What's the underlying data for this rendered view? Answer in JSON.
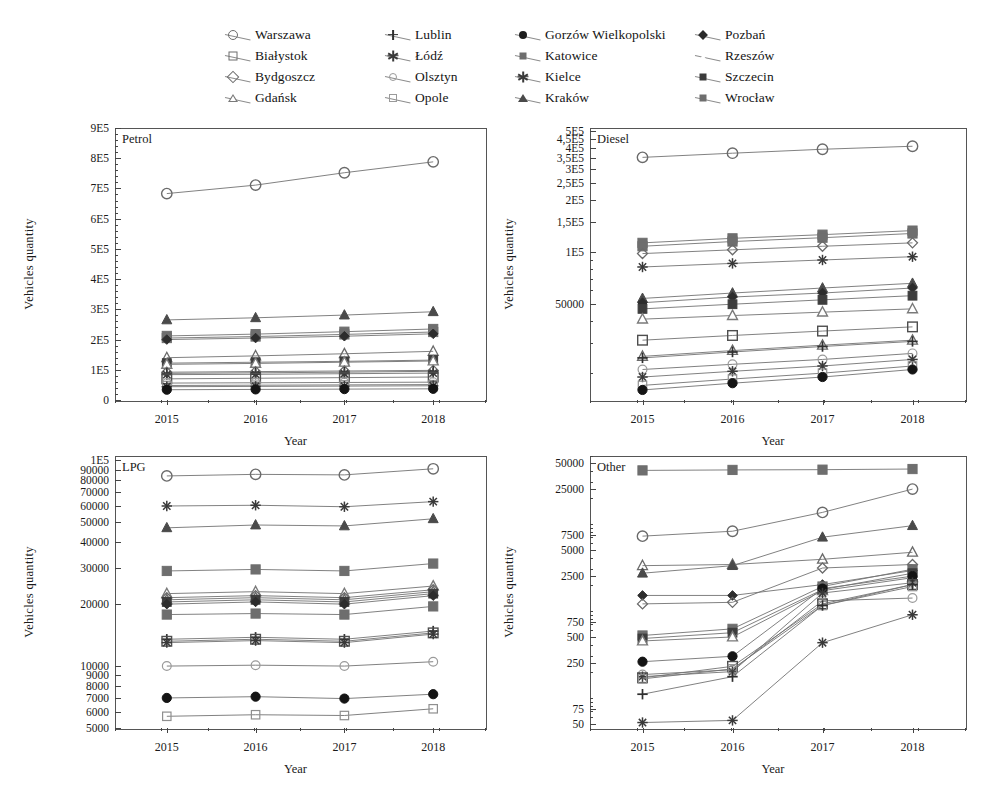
{
  "figure": {
    "axis_y_label": "Vehicles quantity",
    "axis_x_label": "Year",
    "years": [
      "2015",
      "2016",
      "2017",
      "2018"
    ]
  },
  "legend": {
    "columns": [
      {
        "items": [
          {
            "label": "Warszawa",
            "marker": "circle-o"
          },
          {
            "label": "Białystok",
            "marker": "square-o"
          },
          {
            "label": "Bydgoszcz",
            "marker": "diamond-o"
          },
          {
            "label": "Gdańsk",
            "marker": "tri-ow"
          }
        ]
      },
      {
        "items": [
          {
            "label": "Lublin",
            "marker": "plus"
          },
          {
            "label": "Łódź",
            "marker": "star"
          },
          {
            "label": "Olsztyn",
            "marker": "circle-sm"
          },
          {
            "label": "Opole",
            "marker": "square-sm"
          }
        ]
      },
      {
        "items": [
          {
            "label": "Gorzów Wielkopolski",
            "marker": "circle-f"
          },
          {
            "label": "Katowice",
            "marker": "square-f"
          },
          {
            "label": "Kielce",
            "marker": "star"
          },
          {
            "label": "Kraków",
            "marker": "tri-f"
          }
        ]
      },
      {
        "items": [
          {
            "label": "Pozbań",
            "marker": "diamond-f"
          },
          {
            "label": "Rzeszów",
            "marker": "tri-o"
          },
          {
            "label": "Szczecin",
            "marker": "square-dk"
          },
          {
            "label": "Wrocław",
            "marker": "square-f"
          }
        ]
      }
    ]
  },
  "chart_data": [
    {
      "type": "line",
      "title": "Petrol",
      "xlabel": "Year",
      "ylabel": "Vehicles quantity",
      "x": [
        "2015",
        "2016",
        "2017",
        "2018"
      ],
      "yscale": "linear",
      "ylim": [
        0,
        900000
      ],
      "ytick_labels": [
        "0",
        "1E5",
        "2E5",
        "3E5",
        "4E5",
        "5E5",
        "6E5",
        "7E5",
        "8E5",
        "9E5"
      ],
      "ytick_values": [
        0,
        100000,
        200000,
        300000,
        400000,
        500000,
        600000,
        700000,
        800000,
        900000
      ],
      "grid": false,
      "legend_position": "top-external",
      "series": [
        {
          "name": "Warszawa",
          "marker": "circle-o",
          "values": [
            683000,
            711000,
            752000,
            788000
          ]
        },
        {
          "name": "Kraków",
          "marker": "tri-f",
          "values": [
            265000,
            272000,
            281000,
            292000
          ]
        },
        {
          "name": "Wrocław",
          "marker": "square-f",
          "values": [
            212000,
            218000,
            226000,
            235000
          ]
        },
        {
          "name": "Katowice",
          "marker": "square-f",
          "values": [
            205000,
            210000,
            217000,
            225000
          ]
        },
        {
          "name": "Pozbań",
          "marker": "diamond-f",
          "values": [
            200000,
            205000,
            211000,
            219000
          ]
        },
        {
          "name": "Rzeszów",
          "marker": "tri-o",
          "values": [
            140000,
            146000,
            153000,
            161000
          ]
        },
        {
          "name": "Szczecin",
          "marker": "square-dk",
          "values": [
            122000,
            125000,
            128000,
            132000
          ]
        },
        {
          "name": "Gdańsk",
          "marker": "tri-ow",
          "values": [
            118000,
            121000,
            125000,
            129000
          ]
        },
        {
          "name": "Bydgoszcz",
          "marker": "diamond-o",
          "values": [
            92000,
            94000,
            96000,
            98000
          ]
        },
        {
          "name": "Lublin",
          "marker": "plus",
          "values": [
            88000,
            90000,
            92000,
            95000
          ]
        },
        {
          "name": "Łódź",
          "marker": "star",
          "values": [
            84000,
            85000,
            87000,
            89000
          ]
        },
        {
          "name": "Białystok",
          "marker": "square-o",
          "values": [
            70000,
            72000,
            74000,
            76000
          ]
        },
        {
          "name": "Olsztyn",
          "marker": "circle-sm",
          "values": [
            56000,
            57000,
            58000,
            59000
          ]
        },
        {
          "name": "Opole",
          "marker": "square-sm",
          "values": [
            48000,
            49000,
            50000,
            51000
          ]
        },
        {
          "name": "Kielce",
          "marker": "star",
          "values": [
            44000,
            45000,
            46000,
            47000
          ]
        },
        {
          "name": "Gorzów Wielkopolski",
          "marker": "circle-f",
          "values": [
            34000,
            35000,
            36000,
            37000
          ]
        }
      ]
    },
    {
      "type": "line",
      "title": "Diesel",
      "xlabel": "Year",
      "ylabel": "Vehicles quantity",
      "x": [
        "2015",
        "2016",
        "2017",
        "2018"
      ],
      "yscale": "log",
      "ylim": [
        14000,
        520000
      ],
      "ytick_labels": [
        "50000",
        "1E5",
        "1,5E5",
        "2E5",
        "2,5E5",
        "3E5",
        "3,5E5",
        "4E5",
        "4,5E5",
        "5E5"
      ],
      "ytick_values": [
        50000,
        100000,
        150000,
        200000,
        250000,
        300000,
        350000,
        400000,
        450000,
        500000
      ],
      "grid": false,
      "legend_position": "top-external",
      "series": [
        {
          "name": "Warszawa",
          "marker": "circle-o",
          "values": [
            352000,
            372000,
            392000,
            408000
          ]
        },
        {
          "name": "Katowice",
          "marker": "square-f",
          "values": [
            113000,
            120000,
            126000,
            133000
          ]
        },
        {
          "name": "Wrocław",
          "marker": "square-f",
          "values": [
            108000,
            115000,
            121000,
            128000
          ]
        },
        {
          "name": "Bydgoszcz",
          "marker": "diamond-o",
          "values": [
            98000,
            103000,
            108000,
            113000
          ]
        },
        {
          "name": "Łódź",
          "marker": "star",
          "values": [
            82000,
            86000,
            90000,
            94000
          ]
        },
        {
          "name": "Kraków",
          "marker": "tri-f",
          "values": [
            54000,
            58000,
            62000,
            66000
          ]
        },
        {
          "name": "Pozbań",
          "marker": "diamond-f",
          "values": [
            51000,
            55000,
            58000,
            62000
          ]
        },
        {
          "name": "Szczecin",
          "marker": "square-dk",
          "values": [
            47000,
            50000,
            53000,
            56000
          ]
        },
        {
          "name": "Gdańsk",
          "marker": "tri-ow",
          "values": [
            41000,
            43000,
            45000,
            47000
          ]
        },
        {
          "name": "Białystok",
          "marker": "square-o",
          "values": [
            31000,
            33000,
            35000,
            37000
          ]
        },
        {
          "name": "Rzeszów",
          "marker": "tri-o",
          "values": [
            25000,
            27000,
            29000,
            31000
          ]
        },
        {
          "name": "Lublin",
          "marker": "plus",
          "values": [
            24500,
            26500,
            28500,
            30500
          ]
        },
        {
          "name": "Olsztyn",
          "marker": "circle-sm",
          "values": [
            21000,
            22500,
            24000,
            26000
          ]
        },
        {
          "name": "Kielce",
          "marker": "star",
          "values": [
            19000,
            20500,
            22000,
            24000
          ]
        },
        {
          "name": "Opole",
          "marker": "square-sm",
          "values": [
            17000,
            18500,
            20000,
            22000
          ]
        },
        {
          "name": "Gorzów Wielkopolski",
          "marker": "circle-f",
          "values": [
            16000,
            17500,
            19000,
            21000
          ]
        }
      ]
    },
    {
      "type": "line",
      "title": "LPG",
      "xlabel": "Year",
      "ylabel": "Vehicles quantity",
      "x": [
        "2015",
        "2016",
        "2017",
        "2018"
      ],
      "yscale": "log",
      "ylim": [
        5000,
        105000
      ],
      "ytick_labels": [
        "5000",
        "6000",
        "7000",
        "8000",
        "9000",
        "10000",
        "20000",
        "30000",
        "40000",
        "50000",
        "60000",
        "70000",
        "80000",
        "90000",
        "1E5"
      ],
      "ytick_values": [
        5000,
        6000,
        7000,
        8000,
        9000,
        10000,
        20000,
        30000,
        40000,
        50000,
        60000,
        70000,
        80000,
        90000,
        100000
      ],
      "grid": false,
      "legend_position": "top-external",
      "series": [
        {
          "name": "Warszawa",
          "marker": "circle-o",
          "values": [
            84000,
            85500,
            85000,
            91000
          ]
        },
        {
          "name": "Łódź",
          "marker": "star",
          "values": [
            60000,
            60500,
            59500,
            63000
          ]
        },
        {
          "name": "Kraków",
          "marker": "tri-f",
          "values": [
            47000,
            48500,
            48000,
            52000
          ]
        },
        {
          "name": "Katowice",
          "marker": "square-f",
          "values": [
            29000,
            29500,
            29000,
            31500
          ]
        },
        {
          "name": "Gdańsk",
          "marker": "tri-ow",
          "values": [
            22500,
            23000,
            22500,
            24500
          ]
        },
        {
          "name": "Bydgoszcz",
          "marker": "diamond-o",
          "values": [
            21500,
            22000,
            21500,
            23500
          ]
        },
        {
          "name": "Rzeszów",
          "marker": "tri-o",
          "values": [
            21000,
            21500,
            21000,
            23000
          ]
        },
        {
          "name": "Szczecin",
          "marker": "square-dk",
          "values": [
            20500,
            21000,
            20500,
            22500
          ]
        },
        {
          "name": "Pozbań",
          "marker": "diamond-f",
          "values": [
            20000,
            20500,
            20000,
            22000
          ]
        },
        {
          "name": "Wrocław",
          "marker": "square-f",
          "values": [
            17800,
            18000,
            17800,
            19500
          ]
        },
        {
          "name": "Lublin",
          "marker": "plus",
          "values": [
            13500,
            13800,
            13500,
            14800
          ]
        },
        {
          "name": "Białystok",
          "marker": "square-o",
          "values": [
            13200,
            13500,
            13200,
            14500
          ]
        },
        {
          "name": "Kielce",
          "marker": "star",
          "values": [
            13000,
            13300,
            13000,
            14300
          ]
        },
        {
          "name": "Olsztyn",
          "marker": "circle-sm",
          "values": [
            10000,
            10100,
            10000,
            10500
          ]
        },
        {
          "name": "Gorzów Wielkopolski",
          "marker": "circle-f",
          "values": [
            7000,
            7100,
            6950,
            7300
          ]
        },
        {
          "name": "Opole",
          "marker": "square-sm",
          "values": [
            5700,
            5800,
            5750,
            6200
          ]
        }
      ]
    },
    {
      "type": "line",
      "title": "Other",
      "xlabel": "Year",
      "ylabel": "Vehicles quantity",
      "x": [
        "2015",
        "2016",
        "2017",
        "2018"
      ],
      "yscale": "log",
      "ylim": [
        45,
        60000
      ],
      "ytick_labels": [
        "50",
        "75",
        "250",
        "500",
        "750",
        "2500",
        "5000",
        "7500",
        "25000",
        "50000"
      ],
      "ytick_values": [
        50,
        75,
        250,
        500,
        750,
        2500,
        5000,
        7500,
        25000,
        50000
      ],
      "grid": false,
      "legend_position": "top-external",
      "series": [
        {
          "name": "Katowice",
          "marker": "square-f",
          "values": [
            41000,
            41500,
            41800,
            42500
          ]
        },
        {
          "name": "Warszawa",
          "marker": "circle-o",
          "values": [
            7200,
            8200,
            13500,
            25000
          ]
        },
        {
          "name": "Rzeszów",
          "marker": "tri-o",
          "values": [
            3300,
            3400,
            3900,
            4700
          ]
        },
        {
          "name": "Kraków",
          "marker": "tri-f",
          "values": [
            2700,
            3300,
            7000,
            9500
          ]
        },
        {
          "name": "Pozbań",
          "marker": "diamond-f",
          "values": [
            1500,
            1500,
            2000,
            2900
          ]
        },
        {
          "name": "Bydgoszcz",
          "marker": "diamond-o",
          "values": [
            1200,
            1250,
            3100,
            3400
          ]
        },
        {
          "name": "Wrocław",
          "marker": "square-f",
          "values": [
            520,
            620,
            1900,
            3000
          ]
        },
        {
          "name": "Szczecin",
          "marker": "square-dk",
          "values": [
            480,
            560,
            1750,
            2700
          ]
        },
        {
          "name": "Gdańsk",
          "marker": "tri-ow",
          "values": [
            450,
            500,
            1700,
            2400
          ]
        },
        {
          "name": "Gorzów Wielkopolski",
          "marker": "circle-f",
          "values": [
            260,
            300,
            1800,
            2500
          ]
        },
        {
          "name": "Olsztyn",
          "marker": "circle-sm",
          "values": [
            185,
            210,
            1300,
            1400
          ]
        },
        {
          "name": "Kielce",
          "marker": "star",
          "values": [
            175,
            200,
            1600,
            2100
          ]
        },
        {
          "name": "Białystok",
          "marker": "square-o",
          "values": [
            170,
            230,
            1200,
            2000
          ]
        },
        {
          "name": "Opole",
          "marker": "square-sm",
          "values": [
            165,
            215,
            1150,
            1900
          ]
        },
        {
          "name": "Lublin",
          "marker": "plus",
          "values": [
            110,
            175,
            1150,
            2000
          ]
        },
        {
          "name": "Łódź",
          "marker": "star",
          "values": [
            52,
            55,
            430,
            900
          ]
        }
      ]
    }
  ]
}
